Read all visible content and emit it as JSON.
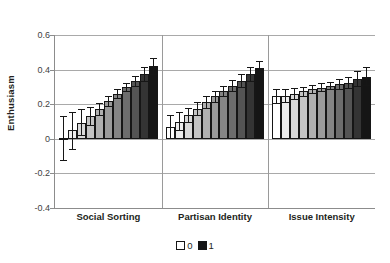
{
  "chart_data": {
    "type": "bar",
    "title": "",
    "xlabel": "",
    "ylabel": "Enthusiasm",
    "ylim": [
      -0.4,
      0.6
    ],
    "yticks": [
      0.6,
      0.4,
      0.2,
      0,
      -0.2,
      -0.4
    ],
    "ytick_labels": [
      "0.6",
      "0.4",
      "0.2",
      "0",
      "-0.2",
      "-0.4"
    ],
    "grid": true,
    "legend_position": "bottom",
    "legend": [
      {
        "label": "0",
        "color": "#ffffff"
      },
      {
        "label": "1",
        "color": "#151515"
      }
    ],
    "categories": [
      "Social Sorting",
      "Partisan Identity",
      "Issue Intensity"
    ],
    "note": "Each category contains 11 bars shaded from white (0) to black (1); vertical lines are 95% confidence intervals.",
    "groups": [
      {
        "name": "Social Sorting",
        "values": [
          0.005,
          0.05,
          0.09,
          0.13,
          0.17,
          0.22,
          0.26,
          0.3,
          0.335,
          0.375,
          0.42
        ],
        "ci_low": [
          -0.12,
          -0.06,
          0.02,
          0.08,
          0.135,
          0.19,
          0.235,
          0.275,
          0.305,
          0.335,
          0.375
        ],
        "ci_high": [
          0.13,
          0.155,
          0.17,
          0.185,
          0.205,
          0.245,
          0.285,
          0.325,
          0.365,
          0.415,
          0.465
        ],
        "shades": [
          "#ffffff",
          "#ededed",
          "#d9d9d9",
          "#c4c4c4",
          "#b0b0b0",
          "#9b9b9b",
          "#858585",
          "#6d6d6d",
          "#545454",
          "#343434",
          "#151515"
        ]
      },
      {
        "name": "Partisan Identity",
        "values": [
          0.07,
          0.1,
          0.135,
          0.175,
          0.21,
          0.245,
          0.275,
          0.305,
          0.335,
          0.375,
          0.41
        ],
        "ci_low": [
          0.005,
          0.05,
          0.095,
          0.14,
          0.18,
          0.215,
          0.245,
          0.275,
          0.3,
          0.335,
          0.375
        ],
        "ci_high": [
          0.14,
          0.155,
          0.18,
          0.215,
          0.245,
          0.275,
          0.305,
          0.34,
          0.375,
          0.415,
          0.45
        ],
        "shades": [
          "#ffffff",
          "#ededed",
          "#d9d9d9",
          "#c4c4c4",
          "#b0b0b0",
          "#9b9b9b",
          "#858585",
          "#6d6d6d",
          "#545454",
          "#343434",
          "#151515"
        ]
      },
      {
        "name": "Issue Intensity",
        "values": [
          0.245,
          0.25,
          0.26,
          0.275,
          0.285,
          0.295,
          0.305,
          0.315,
          0.325,
          0.345,
          0.36
        ],
        "ci_low": [
          0.205,
          0.215,
          0.23,
          0.25,
          0.265,
          0.275,
          0.285,
          0.29,
          0.295,
          0.305,
          0.31
        ],
        "ci_high": [
          0.285,
          0.29,
          0.295,
          0.3,
          0.31,
          0.32,
          0.33,
          0.345,
          0.36,
          0.39,
          0.415
        ],
        "shades": [
          "#ffffff",
          "#ededed",
          "#d9d9d9",
          "#c4c4c4",
          "#b0b0b0",
          "#9b9b9b",
          "#858585",
          "#6d6d6d",
          "#545454",
          "#343434",
          "#151515"
        ]
      }
    ]
  }
}
